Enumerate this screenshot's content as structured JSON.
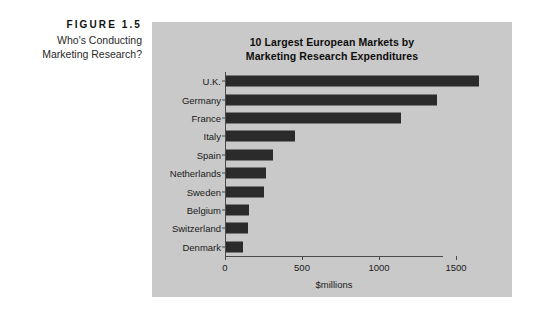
{
  "figure": {
    "number": "FIGURE 1.5",
    "title_line1": "Who's Conducting",
    "title_line2": "Marketing Research?"
  },
  "chart_panel": {
    "background_color": "#c9c9c9",
    "bar_color": "#2b2b2b",
    "axis_color": "#4a4a4a"
  },
  "chart_data": {
    "type": "bar",
    "orientation": "horizontal",
    "title": "10 Largest European Markets by Marketing Research Expenditures",
    "title_line1": "10 Largest European Markets by",
    "title_line2": "Marketing Research Expenditures",
    "xlabel": "$millions",
    "ylabel": "",
    "categories": [
      "U.K.",
      "Germany",
      "France",
      "Italy",
      "Spain",
      "Netherlands",
      "Sweden",
      "Belgium",
      "Switzerland",
      "Denmark"
    ],
    "values": [
      1645,
      1370,
      1135,
      450,
      305,
      260,
      245,
      150,
      143,
      110
    ],
    "xlim": [
      0,
      1700
    ],
    "xticks": [
      0,
      500,
      1000,
      1500
    ],
    "xtick_labels": [
      "0",
      "500",
      "1000",
      "1500"
    ],
    "grid": false,
    "legend": false
  }
}
